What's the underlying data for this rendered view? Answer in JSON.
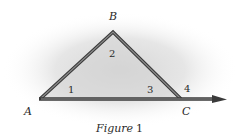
{
  "figure": {
    "caption_word": "Figure",
    "caption_num": "1",
    "vertices": {
      "A": {
        "label": "A",
        "x": 40,
        "y": 99
      },
      "B": {
        "label": "B",
        "x": 113,
        "y": 32
      },
      "C": {
        "label": "C",
        "x": 181,
        "y": 99
      }
    },
    "ray_tip": {
      "x": 226,
      "y": 99
    },
    "angles": [
      {
        "label": "1"
      },
      {
        "label": "2"
      },
      {
        "label": "3"
      },
      {
        "label": "4"
      }
    ],
    "colors": {
      "stroke_outer": "#3a3a3a",
      "stroke_inner": "#8a8a8a",
      "shadow_center": "#d9d9d9",
      "background": "#ffffff"
    }
  }
}
